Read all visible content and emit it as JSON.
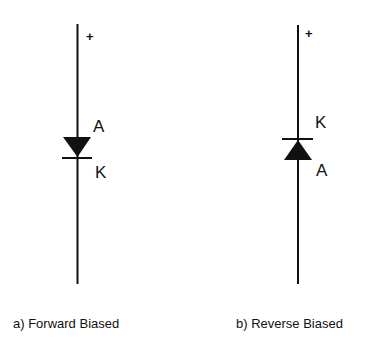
{
  "diagrams": [
    {
      "id": "a",
      "caption": "a) Forward Biased",
      "polarity_label": "+",
      "top_terminal": "A",
      "bottom_terminal": "K",
      "diode_orientation": "pointing-down"
    },
    {
      "id": "b",
      "caption": "b) Reverse Biased",
      "polarity_label": "+",
      "top_terminal": "K",
      "bottom_terminal": "A",
      "diode_orientation": "pointing-up"
    }
  ],
  "colors": {
    "line": "#111111",
    "background": "#ffffff"
  }
}
